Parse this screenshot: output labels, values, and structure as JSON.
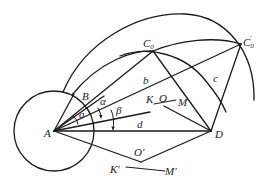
{
  "diagram": {
    "points": {
      "A": "A",
      "B": "B",
      "C0": {
        "base": "C",
        "sub": "0"
      },
      "C0_prime": {
        "base": "C",
        "sub": "0",
        "prime": "′"
      },
      "D": "D",
      "K": "K",
      "O": "O",
      "M": "M",
      "K_prime": "K′",
      "O_prime": "O′",
      "M_prime": "M′"
    },
    "segment_labels": {
      "a": "a",
      "b": "b",
      "c": "c",
      "d": "d"
    },
    "angle_labels": {
      "alpha_1": "α",
      "alpha_2": "α",
      "beta": "β"
    }
  }
}
